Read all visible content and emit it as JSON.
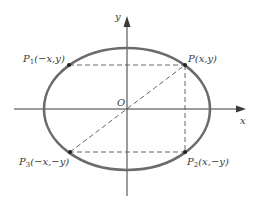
{
  "diagram": {
    "colors": {
      "ellipse": "#6b6b6b",
      "axes": "#3a3a3a",
      "dashed": "#555555",
      "text": "#3a3a3a"
    },
    "axes": {
      "x_label": "x",
      "y_label": "y",
      "origin_label": "O"
    },
    "points": [
      {
        "name": "P",
        "sub": "",
        "coords": "(x,y)"
      },
      {
        "name": "P",
        "sub": "1",
        "coords": "(−x,y)"
      },
      {
        "name": "P",
        "sub": "3",
        "coords": "(−x,−y)"
      },
      {
        "name": "P",
        "sub": "2",
        "coords": "(x,−y)"
      }
    ]
  }
}
